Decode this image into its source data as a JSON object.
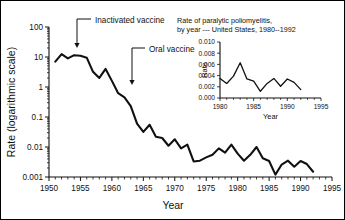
{
  "figure": {
    "background_color": "#ffffff",
    "line_color": "#111111",
    "border": true
  },
  "chart_data": {
    "type": "line",
    "title": "",
    "xlabel": "Year",
    "ylabel": "Rate (logarithmic scale)",
    "yscale": "log",
    "xlim": [
      1950,
      1995
    ],
    "ylim": [
      0.001,
      100
    ],
    "grid": false,
    "legend": "none",
    "xticks": [
      1950,
      1955,
      1960,
      1965,
      1970,
      1975,
      1980,
      1985,
      1990,
      1995
    ],
    "xtick_labels": [
      "1950",
      "1955",
      "1960",
      "1965",
      "1970",
      "1975",
      "1980",
      "1985",
      "1990",
      "1995"
    ],
    "yticks": [
      0.001,
      0.01,
      0.1,
      1,
      10,
      100
    ],
    "ytick_labels": [
      "0.001",
      "0.01",
      "0.1",
      "1",
      "10",
      "100"
    ],
    "x": [
      1951,
      1952,
      1953,
      1954,
      1955,
      1956,
      1957,
      1958,
      1959,
      1960,
      1961,
      1962,
      1963,
      1964,
      1965,
      1966,
      1967,
      1968,
      1969,
      1970,
      1971,
      1972,
      1973,
      1974,
      1975,
      1976,
      1977,
      1978,
      1979,
      1980,
      1981,
      1982,
      1983,
      1984,
      1985,
      1986,
      1987,
      1988,
      1989,
      1990,
      1991,
      1992
    ],
    "values": [
      7.0,
      12.5,
      9.0,
      11.5,
      11.0,
      9.5,
      3.2,
      2.0,
      4.0,
      1.6,
      0.62,
      0.45,
      0.23,
      0.06,
      0.032,
      0.055,
      0.022,
      0.02,
      0.011,
      0.018,
      0.009,
      0.012,
      0.0033,
      0.0035,
      0.0045,
      0.0055,
      0.009,
      0.0065,
      0.012,
      0.006,
      0.0035,
      0.0055,
      0.01,
      0.0042,
      0.0034,
      0.0012,
      0.0026,
      0.0035,
      0.0022,
      0.0034,
      0.0027,
      0.0015
    ],
    "annotations": [
      {
        "label": "Inactivated vaccine",
        "year": 1955
      },
      {
        "label": "Oral vaccine",
        "year": 1961
      }
    ],
    "inset": {
      "type": "line",
      "title_line1": "Rate of paralytic poliomyelitis,",
      "title_line2": "by year --- United States, 1980--1992",
      "xlabel": "Year",
      "ylabel": "Rate",
      "xlim": [
        1980,
        1995
      ],
      "ylim": [
        0.0,
        0.01
      ],
      "grid": false,
      "xticks": [
        1980,
        1985,
        1990,
        1995
      ],
      "xtick_labels": [
        "1980",
        "1985",
        "1990",
        "1995"
      ],
      "yticks": [
        0.0,
        0.002,
        0.004,
        0.006,
        0.008,
        0.01
      ],
      "ytick_labels": [
        "0.000",
        "0.002",
        "0.004",
        "0.006",
        "0.008",
        "0.010"
      ],
      "x": [
        1980,
        1981,
        1982,
        1983,
        1984,
        1985,
        1986,
        1987,
        1988,
        1989,
        1990,
        1991,
        1992
      ],
      "values": [
        0.0035,
        0.0026,
        0.0039,
        0.0063,
        0.0034,
        0.003,
        0.0012,
        0.0026,
        0.0035,
        0.0021,
        0.0034,
        0.0028,
        0.0015
      ]
    }
  }
}
